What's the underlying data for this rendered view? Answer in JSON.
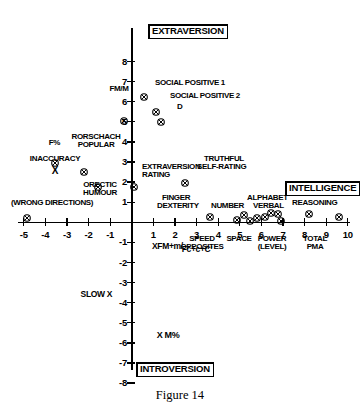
{
  "caption": "Figure 14",
  "chart_data": {
    "type": "scatter",
    "title": "Figure 14",
    "xlabel": "INTELLIGENCE",
    "ylabel": "EXTRAVERSION",
    "xlim": [
      -5.6,
      10.6
    ],
    "ylim": [
      -8.6,
      8.6
    ],
    "grid": false,
    "legend": "none",
    "axis_poles": {
      "top": "EXTRAVERSION",
      "bottom": "INTROVERSION",
      "right": "INTELLIGENCE"
    },
    "xticks": [
      -5,
      -4,
      -3,
      -2,
      -1,
      1,
      2,
      3,
      4,
      5,
      6,
      7,
      8,
      9,
      10
    ],
    "xticklabels": [
      "-5",
      "-4",
      "-3",
      "-2",
      "-1",
      "1",
      "2",
      "3",
      "4",
      "5",
      "6",
      "7",
      "8",
      "9",
      "10"
    ],
    "yticks": [
      -8,
      -7,
      -6,
      -5,
      -4,
      -3,
      -2,
      -1,
      1,
      2,
      3,
      4,
      5,
      6,
      7,
      8
    ],
    "yticklabels": [
      "-8",
      "-7",
      "-6",
      "-5",
      "-4",
      "-3",
      "-2",
      "-1",
      "1",
      "2",
      "3",
      "4",
      "5",
      "6",
      "7",
      "8"
    ],
    "marker": "circle-with-cross",
    "points": [
      {
        "label": "SOCIAL POSITIVE 1",
        "x": 0.55,
        "y": 6.25,
        "marker": "circle-cross",
        "label_pos": "right"
      },
      {
        "label": "SOCIAL POSITIVE 2",
        "x": 1.1,
        "y": 5.5,
        "marker": "circle-cross",
        "label_pos": "right"
      },
      {
        "label": "D",
        "x": 1.35,
        "y": 5.0,
        "marker": "circle-cross",
        "label_pos": "right"
      },
      {
        "label": "FM/M",
        "x": -0.35,
        "y": 5.05,
        "marker": "circle-cross",
        "label_pos": "above"
      },
      {
        "label": "F%",
        "x": -3.55,
        "y": 2.95,
        "marker": "circle-cross",
        "label_pos": "left"
      },
      {
        "label": "RORSCHACH POPULAR",
        "x": -2.2,
        "y": 2.5,
        "marker": "circle-cross",
        "label_pos": "above"
      },
      {
        "label": "INACCURACY X",
        "x": -3.0,
        "y": 1.95,
        "marker": "none",
        "label_pos": "center"
      },
      {
        "label": "ORECTIC HUMOUR",
        "x": -1.55,
        "y": 1.75,
        "marker": "circle-cross",
        "label_pos": "below"
      },
      {
        "label": "(WRONG DIRECTIONS)",
        "x": -4.85,
        "y": 0.22,
        "marker": "circle-cross",
        "label_pos": "above"
      },
      {
        "label": "EXTRAVERSION RATING",
        "x": 0.12,
        "y": 1.75,
        "marker": "circle-cross",
        "label_pos": "right"
      },
      {
        "label": "TRUTHFUL SELF-RATING",
        "x": 2.45,
        "y": 1.95,
        "marker": "circle-cross",
        "label_pos": "right"
      },
      {
        "label": "FINGER DEXTERITY",
        "x": 3.6,
        "y": 0.28,
        "marker": "circle-cross",
        "label_pos": "above"
      },
      {
        "label": "SPEED OPPOSITES",
        "x": 4.85,
        "y": 0.1,
        "marker": "circle-cross",
        "label_pos": "below"
      },
      {
        "label": "NUMBER",
        "x": 5.2,
        "y": 0.38,
        "marker": "circle-cross",
        "label_pos": "above"
      },
      {
        "label": "SPACE",
        "x": 5.45,
        "y": 0.05,
        "marker": "circle-cross",
        "label_pos": "below"
      },
      {
        "label": "",
        "x": 5.8,
        "y": 0.22,
        "marker": "circle-cross",
        "label_pos": "none"
      },
      {
        "label": "",
        "x": 6.15,
        "y": 0.25,
        "marker": "circle-cross",
        "label_pos": "none"
      },
      {
        "label": "ALPHABET",
        "x": 6.45,
        "y": 0.45,
        "marker": "circle-cross",
        "label_pos": "above"
      },
      {
        "label": "VERBAL",
        "x": 6.75,
        "y": 0.42,
        "marker": "circle-cross",
        "label_pos": "right"
      },
      {
        "label": "POWER (LEVEL)",
        "x": 6.9,
        "y": 0.05,
        "marker": "circle-cross",
        "label_pos": "below"
      },
      {
        "label": "TOTAL PMA",
        "x": 8.2,
        "y": 0.42,
        "marker": "circle-cross",
        "label_pos": "below"
      },
      {
        "label": "REASONING",
        "x": 9.6,
        "y": 0.25,
        "marker": "circle-cross",
        "label_pos": "above"
      },
      {
        "label": "XFM+m/Fc+c+C'",
        "x": 0.85,
        "y": -0.95,
        "marker": "none",
        "label_pos": "center"
      },
      {
        "label": "SLOW X",
        "x": -0.95,
        "y": -4.0,
        "marker": "none",
        "label_pos": "center"
      },
      {
        "label": "X M%",
        "x": 0.95,
        "y": -6.35,
        "marker": "none",
        "label_pos": "center"
      }
    ],
    "annotations": [
      {
        "text": "SOCIAL POSITIVE 1"
      },
      {
        "text": "SOCIAL POSITIVE 2"
      },
      {
        "text": "D"
      },
      {
        "text": "FM/M"
      },
      {
        "text": "F%"
      },
      {
        "text": "RORSCHACH"
      },
      {
        "text": "POPULAR"
      },
      {
        "text": "INACCURACY"
      },
      {
        "text": "X"
      },
      {
        "text": "ORECTIC"
      },
      {
        "text": "HUMOUR"
      },
      {
        "text": "(WRONG DIRECTIONS)"
      },
      {
        "text": "EXTRAVERSION"
      },
      {
        "text": "RATING"
      },
      {
        "text": "TRUTHFUL"
      },
      {
        "text": "SELF-RATING"
      },
      {
        "text": "FINGER"
      },
      {
        "text": "DEXTERITY"
      },
      {
        "text": "NUMBER"
      },
      {
        "text": "ALPHABET"
      },
      {
        "text": "VERBAL"
      },
      {
        "text": "REASONING"
      },
      {
        "text": "SPEED"
      },
      {
        "text": "OPPOSITES"
      },
      {
        "text": "SPACE"
      },
      {
        "text": "POWER"
      },
      {
        "text": "(LEVEL)"
      },
      {
        "text": "TOTAL"
      },
      {
        "text": "PMA"
      },
      {
        "text": "XFM+m/"
      },
      {
        "text": "Fc+c+C'"
      },
      {
        "text": "SLOW X"
      },
      {
        "text": "X M%"
      }
    ]
  },
  "labels": {
    "extraversion_pole": "EXTRAVERSION",
    "introversion_pole": "INTROVERSION",
    "intelligence_pole": "INTELLIGENCE",
    "social_positive_1": "SOCIAL POSITIVE 1",
    "social_positive_2": "SOCIAL POSITIVE 2",
    "d": "D",
    "fm_m": "FM/M",
    "f_pct": "F%",
    "rorschach": "RORSCHACH",
    "popular": "POPULAR",
    "inaccuracy": "INACCURACY",
    "inaccuracy_x": "X",
    "orectic": "ORECTIC",
    "humour": "HUMOUR",
    "wrong_directions": "(WRONG DIRECTIONS)",
    "extraversion_rating_1": "EXTRAVERSION",
    "extraversion_rating_2": "RATING",
    "truthful": "TRUTHFUL",
    "self_rating": "SELF-RATING",
    "finger": "FINGER",
    "dexterity": "DEXTERITY",
    "number": "NUMBER",
    "alphabet": "ALPHABET",
    "verbal": "VERBAL",
    "reasoning": "REASONING",
    "speed": "SPEED",
    "opposites": "OPPOSITES",
    "space": "SPACE",
    "power": "POWER",
    "level": "(LEVEL)",
    "total": "TOTAL",
    "pma": "PMA",
    "xfm_num": "XFM+m/",
    "xfm_den": "Fc+c+C'",
    "slow_x": "SLOW X",
    "x_m_pct": "X M%"
  }
}
